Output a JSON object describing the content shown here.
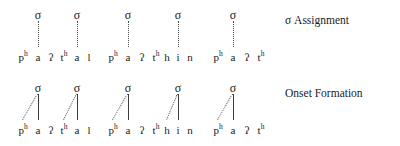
{
  "figure": {
    "width": 400,
    "height": 146,
    "background": "#ffffff",
    "text_color": "#1a1a1a",
    "line_color": "#4a4a4a"
  },
  "glyphs": {
    "sigma": "σ",
    "glottal_stop": "ʔ",
    "superscript_h": "h"
  },
  "rows": [
    {
      "id": "sigma-assignment",
      "label": "σ Assignment",
      "label_x": 285,
      "label_y": 14,
      "sigma_y": 9,
      "segment_y": 52,
      "line_top": 21,
      "line_bottom": 47,
      "words": [
        {
          "id": "word-phaathal",
          "transcription": "pʰ a ʔ tʰ a l",
          "segments": [
            {
              "base": "p",
              "sup": "h",
              "x": 23
            },
            {
              "base": "a",
              "sup": "",
              "x": 38
            },
            {
              "base": "ʔ",
              "sup": "",
              "x": 51
            },
            {
              "base": "t",
              "sup": "h",
              "x": 64
            },
            {
              "base": "a",
              "sup": "",
              "x": 77
            },
            {
              "base": "l",
              "sup": "",
              "x": 89
            }
          ],
          "syllables": [
            {
              "sigma_x": 38,
              "nucleus_x": 38,
              "onset_x": 23
            },
            {
              "sigma_x": 77,
              "nucleus_x": 77,
              "onset_x": 64
            }
          ]
        },
        {
          "id": "word-phaathhin",
          "transcription": "pʰ a ʔ tʰ h i n",
          "segments": [
            {
              "base": "p",
              "sup": "h",
              "x": 113
            },
            {
              "base": "a",
              "sup": "",
              "x": 128
            },
            {
              "base": "ʔ",
              "sup": "",
              "x": 142
            },
            {
              "base": "t",
              "sup": "h",
              "x": 156
            },
            {
              "base": "h",
              "sup": "",
              "x": 167
            },
            {
              "base": "i",
              "sup": "",
              "x": 178
            },
            {
              "base": "n",
              "sup": "",
              "x": 190
            }
          ],
          "syllables": [
            {
              "sigma_x": 128,
              "nucleus_x": 128,
              "onset_x": 113
            },
            {
              "sigma_x": 178,
              "nucleus_x": 178,
              "onset_x": 167
            }
          ]
        },
        {
          "id": "word-phaath",
          "transcription": "pʰ a ʔ tʰ",
          "segments": [
            {
              "base": "p",
              "sup": "h",
              "x": 218
            },
            {
              "base": "a",
              "sup": "",
              "x": 233
            },
            {
              "base": "ʔ",
              "sup": "",
              "x": 247
            },
            {
              "base": "t",
              "sup": "h",
              "x": 261
            }
          ],
          "syllables": [
            {
              "sigma_x": 233,
              "nucleus_x": 233,
              "onset_x": 218
            }
          ]
        }
      ]
    },
    {
      "id": "onset-formation",
      "label": "Onset Formation",
      "label_x": 285,
      "label_y": 87,
      "sigma_y": 82,
      "segment_y": 125,
      "line_top": 94,
      "line_bottom": 120,
      "words": [
        {
          "id": "word-phaathal-onset",
          "transcription": "pʰ a ʔ tʰ a l",
          "segments": [
            {
              "base": "p",
              "sup": "h",
              "x": 23
            },
            {
              "base": "a",
              "sup": "",
              "x": 38
            },
            {
              "base": "ʔ",
              "sup": "",
              "x": 51
            },
            {
              "base": "t",
              "sup": "h",
              "x": 64
            },
            {
              "base": "a",
              "sup": "",
              "x": 77
            },
            {
              "base": "l",
              "sup": "",
              "x": 89
            }
          ],
          "syllables": [
            {
              "sigma_x": 38,
              "nucleus_x": 38,
              "onset_x": 23
            },
            {
              "sigma_x": 77,
              "nucleus_x": 77,
              "onset_x": 64
            }
          ]
        },
        {
          "id": "word-phaathhin-onset",
          "transcription": "pʰ a ʔ tʰ h i n",
          "segments": [
            {
              "base": "p",
              "sup": "h",
              "x": 113
            },
            {
              "base": "a",
              "sup": "",
              "x": 128
            },
            {
              "base": "ʔ",
              "sup": "",
              "x": 142
            },
            {
              "base": "t",
              "sup": "h",
              "x": 156
            },
            {
              "base": "h",
              "sup": "",
              "x": 167
            },
            {
              "base": "i",
              "sup": "",
              "x": 178
            },
            {
              "base": "n",
              "sup": "",
              "x": 190
            }
          ],
          "syllables": [
            {
              "sigma_x": 128,
              "nucleus_x": 128,
              "onset_x": 113
            },
            {
              "sigma_x": 178,
              "nucleus_x": 178,
              "onset_x": 167
            }
          ]
        },
        {
          "id": "word-phaath-onset",
          "transcription": "pʰ a ʔ tʰ",
          "segments": [
            {
              "base": "p",
              "sup": "h",
              "x": 218
            },
            {
              "base": "a",
              "sup": "",
              "x": 233
            },
            {
              "base": "ʔ",
              "sup": "",
              "x": 247
            },
            {
              "base": "t",
              "sup": "h",
              "x": 261
            }
          ],
          "syllables": [
            {
              "sigma_x": 233,
              "nucleus_x": 233,
              "onset_x": 218
            }
          ]
        }
      ]
    }
  ]
}
